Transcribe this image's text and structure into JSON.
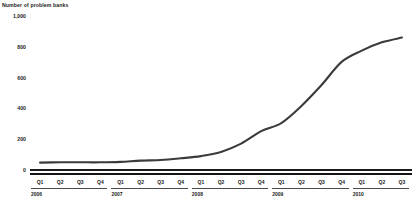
{
  "chart_data": {
    "type": "line",
    "title": "Number of problem banks",
    "xlabel": "",
    "ylabel": "",
    "ylim": [
      0,
      1000
    ],
    "yticks": [
      "0",
      "200",
      "400",
      "600",
      "800",
      "1,000"
    ],
    "ytick_values": [
      0,
      200,
      400,
      600,
      800,
      1000
    ],
    "grid": false,
    "legend": "none",
    "line_color": "#3b3b3b",
    "x": [
      "Q1 2006",
      "Q2 2006",
      "Q3 2006",
      "Q4 2006",
      "Q1 2007",
      "Q2 2007",
      "Q3 2007",
      "Q4 2007",
      "Q1 2008",
      "Q2 2008",
      "Q3 2008",
      "Q4 2008",
      "Q1 2009",
      "Q2 2009",
      "Q3 2009",
      "Q4 2009",
      "Q1 2010",
      "Q2 2010",
      "Q3 2010"
    ],
    "categories": [
      "Q1",
      "Q2",
      "Q3",
      "Q4",
      "Q1",
      "Q2",
      "Q3",
      "Q4",
      "Q1",
      "Q2",
      "Q3",
      "Q4",
      "Q1",
      "Q2",
      "Q3",
      "Q4",
      "Q1",
      "Q2",
      "Q3"
    ],
    "values": [
      48,
      50,
      50,
      50,
      53,
      61,
      65,
      76,
      90,
      117,
      171,
      252,
      305,
      416,
      552,
      702,
      775,
      829,
      860
    ],
    "years": [
      {
        "label": "2006",
        "start_index": 0,
        "quarters": 4
      },
      {
        "label": "2007",
        "start_index": 4,
        "quarters": 4
      },
      {
        "label": "2008",
        "start_index": 8,
        "quarters": 4
      },
      {
        "label": "2009",
        "start_index": 12,
        "quarters": 4
      },
      {
        "label": "2010",
        "start_index": 16,
        "quarters": 3
      }
    ]
  }
}
